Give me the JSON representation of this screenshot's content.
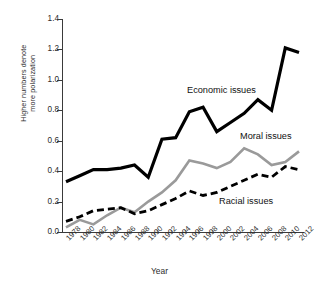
{
  "chart_data": {
    "type": "line",
    "title": "",
    "xlabel": "Year",
    "ylabel": "Higher numbers denote more polarization",
    "ylabel_line1": "Higher numbers denote",
    "ylabel_line2": "more polarization",
    "ylim": [
      0.0,
      1.4
    ],
    "ytick_labels": [
      "1.4",
      "1.2",
      "1.0",
      "0.8",
      "0.6",
      "0.4",
      "0.2",
      "0.0"
    ],
    "ytick_values": [
      1.4,
      1.2,
      1.0,
      0.8,
      0.6,
      0.4,
      0.2,
      0.0
    ],
    "grid": false,
    "legend_position": "inline-annotations",
    "categories": [
      1978,
      1980,
      1982,
      1984,
      1986,
      1988,
      1990,
      1992,
      1994,
      1996,
      1998,
      2000,
      2002,
      2004,
      2006,
      2008,
      2010,
      2012
    ],
    "xtick_labels": [
      "1978",
      "1980",
      "1982",
      "1984",
      "1986",
      "1988",
      "1990",
      "1992",
      "1994",
      "1996",
      "1998",
      "2000",
      "2002",
      "2004",
      "2006",
      "2008",
      "2010",
      "2012"
    ],
    "series": [
      {
        "name": "Economic issues",
        "color": "#000000",
        "style": "solid",
        "width": 3.2,
        "values": [
          0.33,
          0.37,
          0.41,
          0.41,
          0.42,
          0.44,
          0.36,
          0.61,
          0.62,
          0.79,
          0.82,
          0.66,
          0.72,
          0.78,
          0.87,
          0.8,
          1.21,
          1.18
        ]
      },
      {
        "name": "Moral issues",
        "color": "#9a9a9a",
        "style": "solid",
        "width": 2.6,
        "values": [
          0.03,
          0.08,
          0.05,
          0.11,
          0.16,
          0.13,
          0.2,
          0.26,
          0.34,
          0.47,
          0.45,
          0.42,
          0.46,
          0.55,
          0.51,
          0.44,
          0.46,
          0.53
        ]
      },
      {
        "name": "Racial issues",
        "color": "#000000",
        "style": "dashed",
        "width": 2.8,
        "values": [
          0.07,
          0.1,
          0.14,
          0.15,
          0.16,
          0.12,
          0.14,
          0.18,
          0.22,
          0.27,
          0.24,
          0.26,
          0.3,
          0.34,
          0.38,
          0.36,
          0.43,
          0.41
        ]
      }
    ],
    "annotations": [
      {
        "text": "Economic issues",
        "series": "Economic issues"
      },
      {
        "text": "Moral issues",
        "series": "Moral issues"
      },
      {
        "text": "Racial issues",
        "series": "Racial issues"
      }
    ]
  }
}
